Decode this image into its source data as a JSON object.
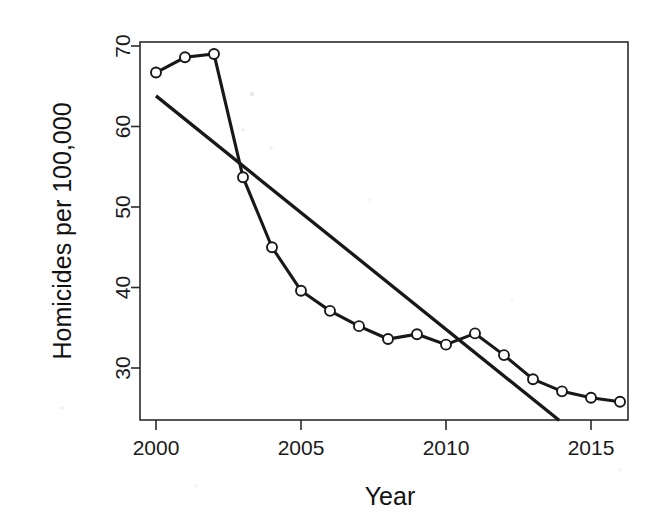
{
  "chart_data": {
    "type": "line",
    "title": "",
    "subtitle": "",
    "xlabel": "Year",
    "ylabel": "Homicides per 100,000",
    "xlim": [
      1999.5,
      2016.5
    ],
    "ylim": [
      23.5,
      70.5
    ],
    "xticks": [
      2000,
      2005,
      2010,
      2015
    ],
    "xtick_labels": [
      "2000",
      "2005",
      "2010",
      "2015"
    ],
    "yticks": [
      30,
      40,
      50,
      60,
      70
    ],
    "ytick_labels": [
      "30",
      "40",
      "50",
      "60",
      "70"
    ],
    "grid": false,
    "legend": null,
    "legend_position": "none",
    "x": [
      2000,
      2001,
      2002,
      2003,
      2004,
      2005,
      2006,
      2007,
      2008,
      2009,
      2010,
      2011,
      2012,
      2013,
      2014,
      2015,
      2016
    ],
    "series": [
      {
        "name": "Homicide rate",
        "marker": "open-circle",
        "values": [
          66.7,
          68.6,
          69.0,
          53.7,
          45.0,
          39.6,
          37.1,
          35.2,
          33.6,
          34.2,
          32.9,
          34.3,
          31.6,
          28.6,
          27.1,
          26.3,
          25.8
        ]
      },
      {
        "name": "Linear trend",
        "marker": "none",
        "x": [
          2000,
          2013.9
        ],
        "values": [
          63.8,
          23.5
        ]
      }
    ]
  },
  "axes": {
    "y_title": "Homicides per 100,000",
    "x_title": "Year"
  }
}
